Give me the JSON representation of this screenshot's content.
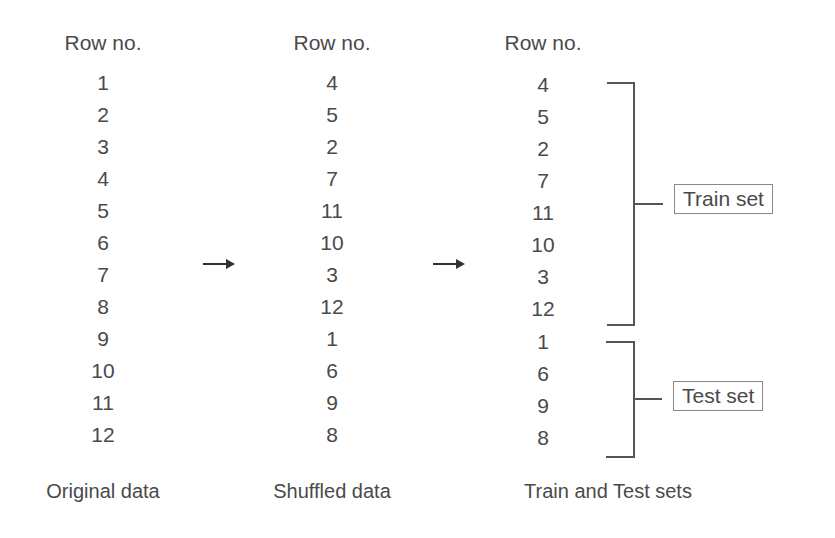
{
  "columns": [
    {
      "header": "Row no.",
      "rows": [
        "1",
        "2",
        "3",
        "4",
        "5",
        "6",
        "7",
        "8",
        "9",
        "10",
        "11",
        "12"
      ],
      "caption": "Original data"
    },
    {
      "header": "Row no.",
      "rows": [
        "4",
        "5",
        "2",
        "7",
        "11",
        "10",
        "3",
        "12",
        "1",
        "6",
        "9",
        "8"
      ],
      "caption": "Shuffled data"
    },
    {
      "header": "Row no.",
      "rows": [
        "4",
        "5",
        "2",
        "7",
        "11",
        "10",
        "3",
        "12",
        "1",
        "6",
        "9",
        "8"
      ],
      "caption": "Train and Test sets"
    }
  ],
  "arrows": [
    "right-arrow",
    "right-arrow"
  ],
  "groups": {
    "train": {
      "label": "Train set",
      "rows": [
        "4",
        "5",
        "2",
        "7",
        "11",
        "10",
        "3",
        "12"
      ]
    },
    "test": {
      "label": "Test set",
      "rows": [
        "1",
        "6",
        "9",
        "8"
      ]
    }
  }
}
